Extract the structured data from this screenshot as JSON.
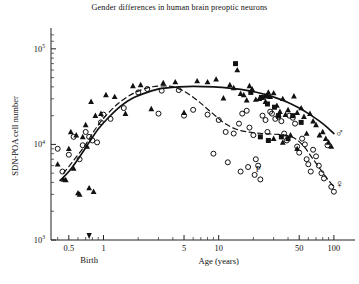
{
  "chart_data": {
    "type": "scatter",
    "title": "Gender differences in human brain preoptic neurons",
    "xlabel": "Age (years)",
    "ylabel": "SDN-POA cell number",
    "xscale": "log",
    "yscale": "log",
    "xlim": [
      0.35,
      130
    ],
    "ylim": [
      1000,
      150000
    ],
    "grid": false,
    "legend": "none",
    "x_ticks": [
      {
        "value": 0.5,
        "label": "0.5"
      },
      {
        "value": 1,
        "label": "1"
      },
      {
        "value": 5,
        "label": "5"
      },
      {
        "value": 10,
        "label": "10"
      },
      {
        "value": 50,
        "label": "50"
      },
      {
        "value": 100,
        "label": "100"
      }
    ],
    "y_ticks": [
      {
        "value": 1000,
        "label": "10",
        "exp": "3"
      },
      {
        "value": 10000,
        "label": "10",
        "exp": "4"
      },
      {
        "value": 100000,
        "label": "10",
        "exp": "5"
      }
    ],
    "annotations": [
      {
        "text": "Birth",
        "x": 0.75,
        "kind": "axis-arrow-label"
      },
      {
        "text": "P",
        "x": 22,
        "y": 5100,
        "kind": "point-label"
      },
      {
        "text": "♂",
        "x": 112,
        "y": 12000,
        "kind": "gender-symbol-male"
      },
      {
        "text": "♀",
        "x": 112,
        "y": 3500,
        "kind": "gender-symbol-female"
      }
    ],
    "series": [
      {
        "name": "Male (filled triangle)",
        "marker": "triangle",
        "color": "#111111",
        "points": [
          [
            0.4,
            6200
          ],
          [
            0.45,
            4300
          ],
          [
            0.47,
            4250
          ],
          [
            0.5,
            9000
          ],
          [
            0.52,
            13500
          ],
          [
            0.55,
            5600
          ],
          [
            0.58,
            12500
          ],
          [
            0.6,
            3100
          ],
          [
            0.62,
            3000
          ],
          [
            0.66,
            12000
          ],
          [
            0.7,
            16000
          ],
          [
            0.72,
            9500
          ],
          [
            0.78,
            28000
          ],
          [
            0.85,
            20000
          ],
          [
            0.95,
            21000
          ],
          [
            1.05,
            33000
          ],
          [
            1.25,
            31500
          ],
          [
            1.55,
            21000
          ],
          [
            1.8,
            41000
          ],
          [
            2.1,
            42000
          ],
          [
            2.6,
            23500
          ],
          [
            3.3,
            44000
          ],
          [
            4.2,
            45000
          ],
          [
            5.0,
            21500
          ],
          [
            6.5,
            46000
          ],
          [
            8.0,
            45000
          ],
          [
            9.5,
            48000
          ],
          [
            11.0,
            30500
          ],
          [
            12.5,
            42000
          ],
          [
            13.5,
            39000
          ],
          [
            14.5,
            60000
          ],
          [
            15.5,
            34000
          ],
          [
            16.5,
            33000
          ],
          [
            17.5,
            29000
          ],
          [
            18.5,
            41000
          ],
          [
            19.5,
            38000
          ],
          [
            21.0,
            29500
          ],
          [
            22.5,
            30000
          ],
          [
            24.0,
            31000
          ],
          [
            25.5,
            28000
          ],
          [
            27.0,
            35000
          ],
          [
            28.0,
            31500
          ],
          [
            30.0,
            34500
          ],
          [
            32.0,
            25500
          ],
          [
            34.0,
            22000
          ],
          [
            36.0,
            30000
          ],
          [
            38.0,
            20500
          ],
          [
            40.0,
            23000
          ],
          [
            42.0,
            12500
          ],
          [
            45.0,
            32000
          ],
          [
            48.0,
            21500
          ],
          [
            52.0,
            24000
          ],
          [
            55.0,
            19500
          ],
          [
            58.0,
            13000
          ],
          [
            62.0,
            21000
          ],
          [
            66.0,
            17500
          ],
          [
            70.0,
            16000
          ],
          [
            75.0,
            12500
          ],
          [
            80.0,
            13500
          ],
          [
            85.0,
            11500
          ],
          [
            90.0,
            10500
          ],
          [
            95.0,
            9500
          ],
          [
            30.0,
            11500
          ],
          [
            36.0,
            10500
          ],
          [
            48.0,
            9000
          ],
          [
            0.75,
            3500
          ],
          [
            0.82,
            3200
          ]
        ]
      },
      {
        "name": "Male (filled square)",
        "marker": "square",
        "color": "#111111",
        "points": [
          [
            14.0,
            70000
          ],
          [
            19.0,
            35000
          ],
          [
            23.5,
            31000
          ],
          [
            26.0,
            32000
          ],
          [
            26.5,
            26500
          ],
          [
            30.5,
            24500
          ],
          [
            33.0,
            20000
          ],
          [
            35.0,
            12000
          ],
          [
            40.0,
            11500
          ],
          [
            44.0,
            20000
          ],
          [
            52.0,
            17000
          ],
          [
            23.0,
            12000
          ],
          [
            27.0,
            11000
          ]
        ]
      },
      {
        "name": "Female (open circle)",
        "marker": "circle",
        "color": "#111111",
        "points": [
          [
            0.4,
            9000
          ],
          [
            0.44,
            5200
          ],
          [
            0.5,
            7800
          ],
          [
            0.55,
            12000
          ],
          [
            0.62,
            7000
          ],
          [
            0.66,
            9800
          ],
          [
            0.7,
            13500
          ],
          [
            0.75,
            12000
          ],
          [
            0.8,
            11000
          ],
          [
            0.88,
            10500
          ],
          [
            0.95,
            17000
          ],
          [
            1.0,
            20500
          ],
          [
            1.15,
            18500
          ],
          [
            1.5,
            24000
          ],
          [
            2.0,
            35000
          ],
          [
            2.4,
            38000
          ],
          [
            3.2,
            36500
          ],
          [
            4.5,
            37000
          ],
          [
            6.0,
            23000
          ],
          [
            8.0,
            20500
          ],
          [
            10.0,
            18000
          ],
          [
            11.5,
            13500
          ],
          [
            13.5,
            13000
          ],
          [
            15.0,
            16500
          ],
          [
            16.0,
            21000
          ],
          [
            17.5,
            22500
          ],
          [
            18.5,
            15000
          ],
          [
            20.0,
            12500
          ],
          [
            21.0,
            7000
          ],
          [
            22.0,
            6000
          ],
          [
            23.0,
            4300
          ],
          [
            24.0,
            20000
          ],
          [
            25.5,
            18000
          ],
          [
            26.5,
            13500
          ],
          [
            28.0,
            22000
          ],
          [
            29.0,
            21000
          ],
          [
            31.0,
            18500
          ],
          [
            33.0,
            19500
          ],
          [
            35.0,
            17500
          ],
          [
            37.0,
            13000
          ],
          [
            39.0,
            11000
          ],
          [
            41.0,
            20000
          ],
          [
            44.0,
            19000
          ],
          [
            46.0,
            16500
          ],
          [
            48.0,
            9500
          ],
          [
            50.0,
            8200
          ],
          [
            53.0,
            11500
          ],
          [
            56.0,
            10000
          ],
          [
            58.0,
            7000
          ],
          [
            60.0,
            6200
          ],
          [
            63.0,
            5200
          ],
          [
            66.0,
            8800
          ],
          [
            70.0,
            7500
          ],
          [
            74.0,
            6000
          ],
          [
            78.0,
            5000
          ],
          [
            82.0,
            4400
          ],
          [
            88.0,
            9800
          ],
          [
            95.0,
            3600
          ],
          [
            100.0,
            3200
          ],
          [
            18.0,
            5800
          ],
          [
            20.5,
            4800
          ],
          [
            12.0,
            6500
          ],
          [
            9.0,
            8000
          ],
          [
            15.5,
            5200
          ],
          [
            3.0,
            21000
          ],
          [
            5.0,
            20000
          ]
        ]
      }
    ],
    "curves": [
      {
        "name": "male-fit",
        "style": "solid",
        "points": [
          [
            0.42,
            4200
          ],
          [
            0.5,
            5200
          ],
          [
            0.6,
            7000
          ],
          [
            0.75,
            10500
          ],
          [
            0.9,
            14500
          ],
          [
            1.1,
            19000
          ],
          [
            1.4,
            25000
          ],
          [
            1.8,
            30500
          ],
          [
            2.4,
            35000
          ],
          [
            3.2,
            38500
          ],
          [
            4.5,
            40000
          ],
          [
            6.0,
            40500
          ],
          [
            9.0,
            40000
          ],
          [
            13.0,
            38500
          ],
          [
            18.0,
            36500
          ],
          [
            25.0,
            33500
          ],
          [
            32.0,
            30500
          ],
          [
            40.0,
            27500
          ],
          [
            50.0,
            24000
          ],
          [
            62.0,
            20500
          ],
          [
            75.0,
            17500
          ],
          [
            88.0,
            15000
          ],
          [
            100.0,
            13000
          ]
        ]
      },
      {
        "name": "female-fit",
        "style": "dashed",
        "points": [
          [
            0.45,
            5000
          ],
          [
            0.55,
            6800
          ],
          [
            0.7,
            10000
          ],
          [
            0.85,
            14500
          ],
          [
            1.05,
            20000
          ],
          [
            1.35,
            27000
          ],
          [
            1.8,
            34000
          ],
          [
            2.4,
            39000
          ],
          [
            3.2,
            41000
          ],
          [
            4.0,
            40000
          ],
          [
            5.0,
            36000
          ],
          [
            6.5,
            29000
          ],
          [
            8.5,
            22000
          ],
          [
            11.0,
            17000
          ],
          [
            14.0,
            14500
          ],
          [
            18.0,
            13500
          ],
          [
            24.0,
            13000
          ],
          [
            30.0,
            12800
          ],
          [
            38.0,
            12500
          ],
          [
            46.0,
            11500
          ],
          [
            55.0,
            9500
          ],
          [
            65.0,
            7200
          ],
          [
            78.0,
            5300
          ],
          [
            90.0,
            4200
          ],
          [
            100.0,
            3600
          ]
        ]
      }
    ]
  }
}
